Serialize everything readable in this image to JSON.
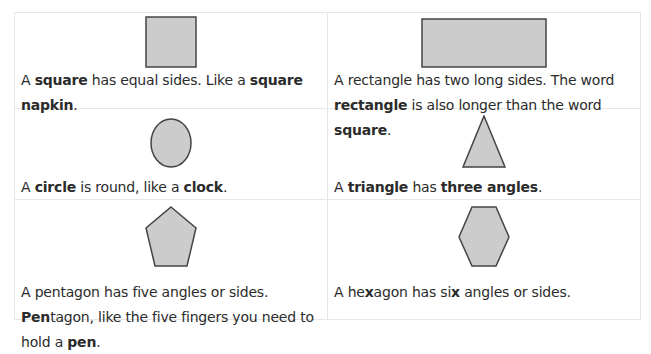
{
  "shape_color": "#cccccc",
  "stroke_color": "#444444",
  "cells": [
    {
      "shape": "square-icon",
      "parts": [
        {
          "t": "A ",
          "b": false
        },
        {
          "t": "square",
          "b": true
        },
        {
          "t": " has equal sides. Like a ",
          "b": false
        },
        {
          "t": "square napkin",
          "b": true
        },
        {
          "t": ".",
          "b": false
        }
      ]
    },
    {
      "shape": "rectangle-icon",
      "parts": [
        {
          "t": "A rectangle has two long sides. The word ",
          "b": false
        },
        {
          "t": "rectangle",
          "b": true
        },
        {
          "t": " is also longer than the word ",
          "b": false
        },
        {
          "t": "square",
          "b": true
        },
        {
          "t": ".",
          "b": false
        }
      ]
    },
    {
      "shape": "circle-icon",
      "parts": [
        {
          "t": "A ",
          "b": false
        },
        {
          "t": "circle",
          "b": true
        },
        {
          "t": " is round, like a ",
          "b": false
        },
        {
          "t": "clock",
          "b": true
        },
        {
          "t": ".",
          "b": false
        }
      ]
    },
    {
      "shape": "triangle-icon",
      "parts": [
        {
          "t": "A ",
          "b": false
        },
        {
          "t": "triangle",
          "b": true
        },
        {
          "t": " has ",
          "b": false
        },
        {
          "t": "three angles",
          "b": true
        },
        {
          "t": ".",
          "b": false
        }
      ]
    },
    {
      "shape": "pentagon-icon",
      "parts": [
        {
          "t": "A pentagon has five angles or sides. ",
          "b": false
        },
        {
          "t": "Pen",
          "b": true
        },
        {
          "t": "tagon, like the five fingers you need to hold a ",
          "b": false
        },
        {
          "t": "pen",
          "b": true
        },
        {
          "t": ".",
          "b": false
        }
      ]
    },
    {
      "shape": "hexagon-icon",
      "parts": [
        {
          "t": "A he",
          "b": false
        },
        {
          "t": "x",
          "b": true
        },
        {
          "t": "agon has si",
          "b": false
        },
        {
          "t": "x",
          "b": true
        },
        {
          "t": " angles or sides.",
          "b": false
        }
      ]
    }
  ]
}
